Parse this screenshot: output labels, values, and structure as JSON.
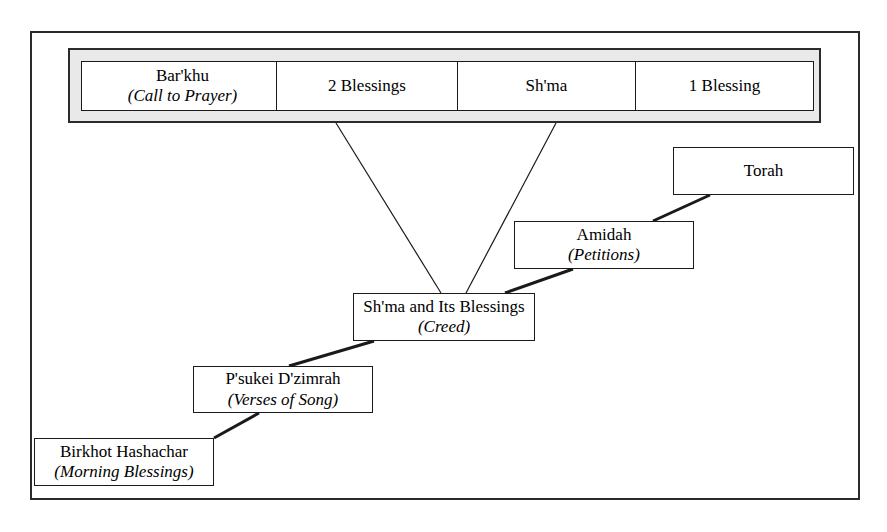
{
  "diagram": {
    "topbar": {
      "name": "shma-expansion-bar",
      "cells": [
        {
          "name": "barkhu",
          "title": "Bar'khu",
          "subtitle": "(Call to Prayer)"
        },
        {
          "name": "two-blessings",
          "title": "2 Blessings",
          "subtitle": ""
        },
        {
          "name": "shma",
          "title": "Sh'ma",
          "subtitle": ""
        },
        {
          "name": "one-blessing",
          "title": "1 Blessing",
          "subtitle": ""
        }
      ]
    },
    "nodes": [
      {
        "name": "torah",
        "title": "Torah",
        "subtitle": ""
      },
      {
        "name": "amidah",
        "title": "Amidah",
        "subtitle": "(Petitions)"
      },
      {
        "name": "shma-and-its-blessings",
        "title": "Sh'ma and Its Blessings",
        "subtitle": "(Creed)"
      },
      {
        "name": "psukei-dzimrah",
        "title": "P'sukei D'zimrah",
        "subtitle": "(Verses of Song)"
      },
      {
        "name": "birkhot-hashachar",
        "title": "Birkhot Hashachar",
        "subtitle": "(Morning Blessings)"
      }
    ],
    "colors": {
      "frame_stroke": "#2b2b2b",
      "box_stroke": "#1a1a1a",
      "topbar_fill": "#e9e9e9",
      "box_fill": "#ffffff",
      "connector": "#1a1a1a",
      "page_background": "#ffffff"
    }
  }
}
